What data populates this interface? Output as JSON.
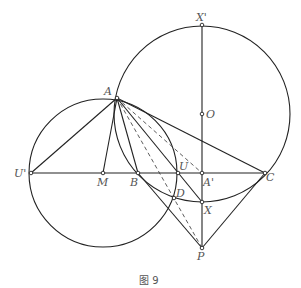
{
  "figure": {
    "caption": "图 9",
    "points": {
      "A": {
        "label": "A",
        "x": 117,
        "y": 98
      },
      "Xp": {
        "label": "X'",
        "x": 202,
        "y": 25
      },
      "O": {
        "label": "O",
        "x": 202,
        "y": 114
      },
      "Up": {
        "label": "U'",
        "x": 31,
        "y": 173
      },
      "M": {
        "label": "M",
        "x": 103,
        "y": 173
      },
      "B": {
        "label": "B",
        "x": 138,
        "y": 173
      },
      "U": {
        "label": "U",
        "x": 178,
        "y": 173
      },
      "Ap": {
        "label": "A'",
        "x": 202,
        "y": 173
      },
      "C": {
        "label": "C",
        "x": 265,
        "y": 173
      },
      "D": {
        "label": "D",
        "x": 174,
        "y": 198
      },
      "X": {
        "label": "X",
        "x": 202,
        "y": 202
      },
      "P": {
        "label": "P",
        "x": 202,
        "y": 248
      }
    },
    "circles": [
      {
        "name": "circle-O",
        "center": "O",
        "r": 88
      },
      {
        "name": "circle-M",
        "center": "M",
        "r": 74
      }
    ],
    "solid_segments": [
      [
        "Up",
        "C"
      ],
      [
        "Xp",
        "P"
      ],
      [
        "A",
        "Up"
      ],
      [
        "A",
        "M"
      ],
      [
        "A",
        "B"
      ],
      [
        "A",
        "C"
      ],
      [
        "A",
        "X"
      ],
      [
        "B",
        "P"
      ],
      [
        "C",
        "P"
      ]
    ],
    "dashed_segments": [
      [
        "A",
        "P"
      ],
      [
        "A",
        "Ap"
      ]
    ]
  }
}
